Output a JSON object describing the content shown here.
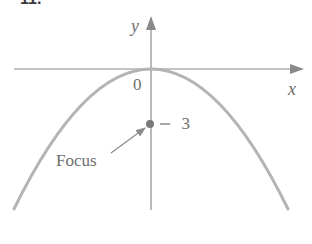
{
  "figure": {
    "label": "11.",
    "axes": {
      "x_label": "x",
      "y_label": "y",
      "origin_label": "0"
    },
    "focus": {
      "label": "Focus",
      "value_label": "−3",
      "coordinates": [
        0,
        -3
      ]
    },
    "curve": {
      "type": "parabola",
      "opens": "down",
      "vertex": [
        0,
        0
      ],
      "equation_implied": "x^2 = -12y"
    },
    "colors": {
      "curve": "#b4b4b4",
      "axes": "#8a8a8a",
      "text": "#6e6e6e",
      "focus_dot": "#7a7a7a"
    }
  }
}
